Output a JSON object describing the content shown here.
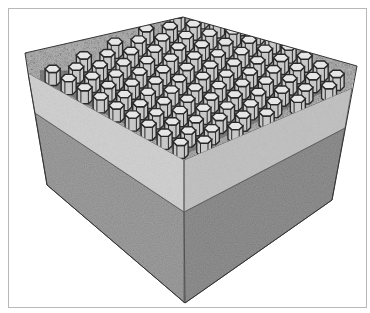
{
  "figure": {
    "layers": [
      {
        "name": "infill aggregate surface",
        "color": "#9a9a9a"
      },
      {
        "name": "hexagonal geocell grid",
        "color": "#d4d4d4"
      },
      {
        "name": "granular base layer",
        "color": "#c9c9c9"
      },
      {
        "name": "subgrade soil",
        "color": "#8f8f8f"
      }
    ],
    "colors": {
      "frame": "#b8b8b8",
      "edge": "#333333",
      "cell_wall": "#2a2a2a",
      "cell_face": "#dcdcdc",
      "gravel": "#a5a5a5",
      "band_left": "#cfcfcf",
      "band_right": "#c2c2c2",
      "soil_left": "#9a9a9a",
      "soil_right": "#8a8a8a"
    }
  }
}
